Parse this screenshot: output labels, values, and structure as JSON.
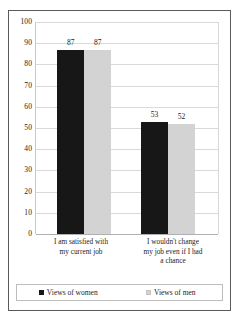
{
  "chart_data": {
    "type": "bar",
    "title": "",
    "subtitle": "",
    "xlabel": "",
    "ylabel": "",
    "ylim": [
      0,
      100
    ],
    "ytick_step": 10,
    "yticks": [
      "100",
      "90",
      "80",
      "70",
      "60",
      "50",
      "40",
      "30",
      "20",
      "10",
      "0"
    ],
    "grid": true,
    "legend_position": "bottom",
    "categories": [
      "I am satisfied with my current job",
      "I wouldn't change my job even if I had a chance"
    ],
    "category_lines": [
      [
        "I am satisfied with",
        "my current job"
      ],
      [
        "I wouldn't change",
        "my job even if I had",
        "a chance"
      ]
    ],
    "series": [
      {
        "name": "Views of women",
        "color": "#171717",
        "values": [
          87,
          53
        ]
      },
      {
        "name": "Views of men",
        "color": "#d3d3d3",
        "values": [
          87,
          52
        ]
      }
    ],
    "data_labels": [
      [
        "87",
        "87"
      ],
      [
        "53",
        "52"
      ]
    ]
  },
  "legend": {
    "entries": [
      {
        "label": "Views of women",
        "swatch": "women"
      },
      {
        "label": "Views of men",
        "swatch": "men"
      }
    ]
  }
}
